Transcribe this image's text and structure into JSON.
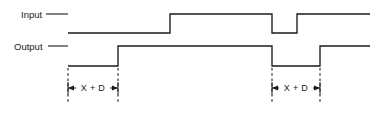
{
  "figure": {
    "kind": "timing-diagram",
    "width": 381,
    "height": 114,
    "background_color": "#ffffff",
    "line_color": "#1a1a1a"
  },
  "signals": [
    {
      "name": "input",
      "label": "Input",
      "label_x": 21,
      "label_y": 18,
      "leader_from_x": 46,
      "leader_to_x": 68,
      "high_y": 14,
      "low_y": 33,
      "start_x": 68,
      "end_x": 370,
      "initial_level": "high",
      "edges": [
        {
          "x": 68,
          "direction": "falling"
        },
        {
          "x": 170,
          "direction": "rising"
        },
        {
          "x": 272,
          "direction": "falling"
        },
        {
          "x": 297,
          "direction": "rising"
        }
      ]
    },
    {
      "name": "output",
      "label": "Output",
      "label_x": 14,
      "label_y": 50,
      "leader_from_x": 48,
      "leader_to_x": 68,
      "high_y": 46,
      "low_y": 66,
      "start_x": 68,
      "end_x": 370,
      "initial_level": "high",
      "edges": [
        {
          "x": 68,
          "direction": "falling"
        },
        {
          "x": 118,
          "direction": "rising"
        },
        {
          "x": 272,
          "direction": "falling"
        },
        {
          "x": 320,
          "direction": "rising"
        }
      ]
    }
  ],
  "dimensions": [
    {
      "name": "delay-left",
      "label": "X + D",
      "from_x": 68,
      "to_x": 118,
      "line_y": 88,
      "ext_top_y": 68,
      "ext_bottom_y": 104,
      "label_x": 93,
      "label_y": 91,
      "arrow_direction": "inward"
    },
    {
      "name": "delay-right",
      "label": "X + D",
      "from_x": 272,
      "to_x": 320,
      "line_y": 88,
      "ext_top_y": 68,
      "ext_bottom_y": 104,
      "label_x": 296,
      "label_y": 91,
      "arrow_direction": "inward"
    }
  ]
}
